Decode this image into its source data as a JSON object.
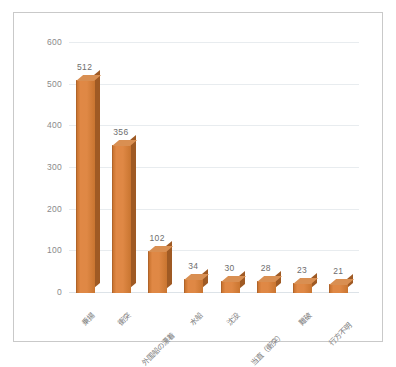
{
  "chart_data": {
    "type": "bar",
    "title": "",
    "subtitle": "",
    "xlabel": "",
    "ylabel": "",
    "categories": [
      "乗揚",
      "衝突",
      "外国船の漂着",
      "水船",
      "沈没",
      "当直（衝突）",
      "難破",
      "行方不明"
    ],
    "values": [
      512,
      356,
      102,
      34,
      30,
      28,
      23,
      21
    ],
    "value_labels": [
      "512",
      "356",
      "102",
      "34",
      "30",
      "28",
      "23",
      "21"
    ],
    "ylim": [
      0,
      600
    ],
    "ytick_labels": [
      "0",
      "100",
      "200",
      "300",
      "400",
      "500",
      "600"
    ],
    "ytick_values": [
      0,
      100,
      200,
      300,
      400,
      500,
      600
    ],
    "grid": true,
    "legend": false,
    "legend_position": "none",
    "style": "3d-column",
    "colors": {
      "bar_front": "#df8845",
      "bar_top": "#d98f52",
      "bar_side": "#9f5a24",
      "gridline": "#e8ecef",
      "axis_text": "#8a8a8a",
      "label_text": "#6d6d6d",
      "frame_border": "#c9c9c9",
      "background": "#ffffff"
    }
  }
}
